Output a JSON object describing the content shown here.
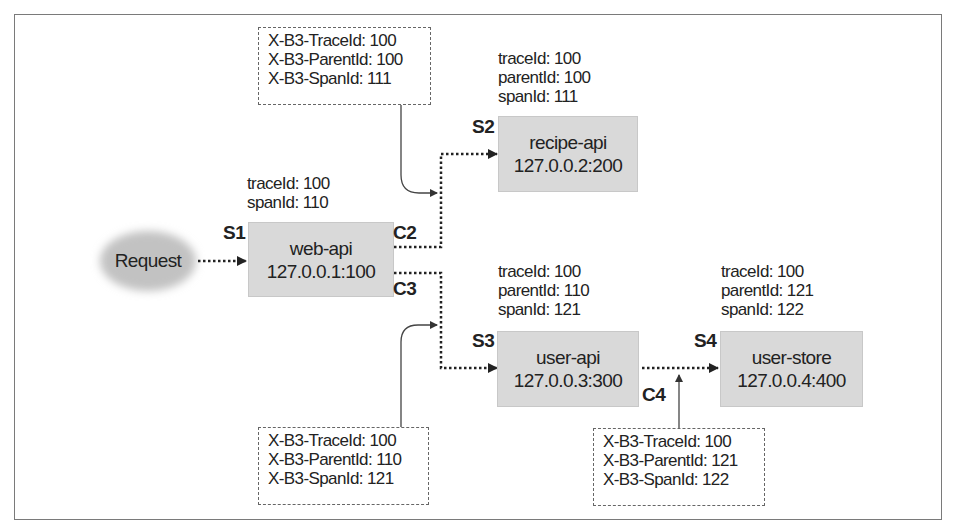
{
  "diagram": {
    "request": {
      "label": "Request"
    },
    "nodes": [
      {
        "id": "S1",
        "name": "web-api",
        "address": "127.0.0.1:100",
        "ids": [
          "traceId: 100",
          "spanId: 110"
        ]
      },
      {
        "id": "S2",
        "name": "recipe-api",
        "address": "127.0.0.2:200",
        "ids": [
          "traceId: 100",
          "parentId: 100",
          "spanId: 111"
        ]
      },
      {
        "id": "S3",
        "name": "user-api",
        "address": "127.0.0.3:300",
        "ids": [
          "traceId: 100",
          "parentId: 110",
          "spanId: 121"
        ]
      },
      {
        "id": "S4",
        "name": "user-store",
        "address": "127.0.0.4:400",
        "ids": [
          "traceId: 100",
          "parentId: 121",
          "spanId: 122"
        ]
      }
    ],
    "clients": [
      "C2",
      "C3",
      "C4"
    ],
    "headers": [
      {
        "for": "C2",
        "lines": [
          "X-B3-TraceId: 100",
          "X-B3-ParentId: 100",
          "X-B3-SpanId: 111"
        ]
      },
      {
        "for": "C3",
        "lines": [
          "X-B3-TraceId: 100",
          "X-B3-ParentId: 110",
          "X-B3-SpanId: 121"
        ]
      },
      {
        "for": "C4",
        "lines": [
          "X-B3-TraceId: 100",
          "X-B3-ParentId: 121",
          "X-B3-SpanId: 122"
        ]
      }
    ],
    "colors": {
      "node_fill": "#d9d9d9",
      "cloud_fill": "#c4c4c4",
      "line": "#333333",
      "frame": "#7a7a7a"
    }
  }
}
